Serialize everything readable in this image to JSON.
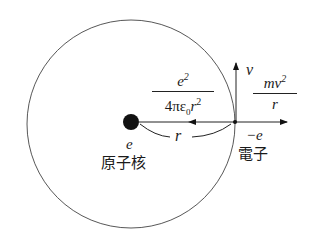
{
  "diagram": {
    "title": "",
    "nucleus": {
      "charge_label": "e",
      "name_label": "原子核"
    },
    "electron": {
      "charge_label": "−e",
      "name_label": "電子"
    },
    "velocity_label": "v",
    "radius_label": "r",
    "coulomb_force": {
      "numerator": "e",
      "numerator_sup": "2",
      "denominator_prefix": "4πε",
      "denominator_sub": "0",
      "denominator_var": "r",
      "denominator_sup": "2"
    },
    "centrifugal_force": {
      "numerator": "mv",
      "numerator_sup": "2",
      "denominator": "r"
    },
    "colors": {
      "stroke": "#333333",
      "fill": "#111111",
      "background": "#ffffff"
    }
  }
}
